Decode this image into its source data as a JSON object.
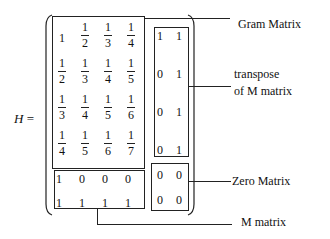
{
  "lhs": {
    "variable": "H",
    "equals": "="
  },
  "gram_matrix": {
    "rows": [
      [
        {
          "n": "1",
          "d": ""
        },
        {
          "n": "1",
          "d": "2"
        },
        {
          "n": "1",
          "d": "3"
        },
        {
          "n": "1",
          "d": "4"
        }
      ],
      [
        {
          "n": "1",
          "d": "2"
        },
        {
          "n": "1",
          "d": "3"
        },
        {
          "n": "1",
          "d": "4"
        },
        {
          "n": "1",
          "d": "5"
        }
      ],
      [
        {
          "n": "1",
          "d": "3"
        },
        {
          "n": "1",
          "d": "4"
        },
        {
          "n": "1",
          "d": "5"
        },
        {
          "n": "1",
          "d": "6"
        }
      ],
      [
        {
          "n": "1",
          "d": "4"
        },
        {
          "n": "1",
          "d": "5"
        },
        {
          "n": "1",
          "d": "6"
        },
        {
          "n": "1",
          "d": "7"
        }
      ]
    ]
  },
  "transpose_matrix": {
    "rows": [
      [
        "1",
        "1"
      ],
      [
        "0",
        "1"
      ],
      [
        "0",
        "1"
      ],
      [
        "0",
        "1"
      ]
    ]
  },
  "m_matrix": {
    "rows": [
      [
        "1",
        "0",
        "0",
        "0"
      ],
      [
        "1",
        "1",
        "1",
        "1"
      ]
    ]
  },
  "zero_matrix": {
    "rows": [
      [
        "0",
        "0"
      ],
      [
        "0",
        "0"
      ]
    ]
  },
  "labels": {
    "gram": "Gram Matrix",
    "transpose_line1": "transpose",
    "transpose_line2": "of M matrix",
    "zero": "Zero Matrix",
    "m": "M matrix"
  }
}
